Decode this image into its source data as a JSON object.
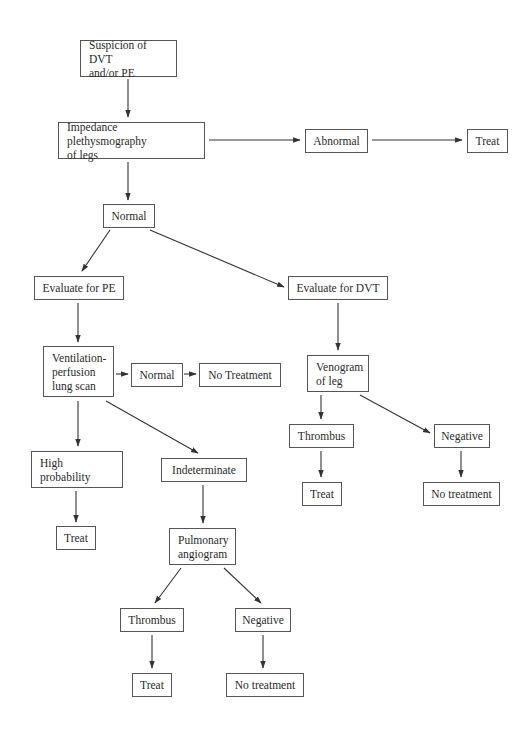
{
  "diagram": {
    "type": "flowchart",
    "title": "",
    "colors": {
      "stroke": "#333333",
      "text": "#2a2a2a",
      "background": "#ffffff"
    },
    "nodes": {
      "suspicion": {
        "label": "Suspicion of DVT\nand/or PE"
      },
      "impedance": {
        "label": "Impedance plethysmography\nof legs"
      },
      "abnormal": {
        "label": "Abnormal"
      },
      "treat_top": {
        "label": "Treat"
      },
      "normal_ipg": {
        "label": "Normal"
      },
      "eval_pe": {
        "label": "Evaluate for PE"
      },
      "eval_dvt": {
        "label": "Evaluate for DVT"
      },
      "vq_scan": {
        "label": "Ventilation-\nperfusion\nlung scan"
      },
      "normal_vq": {
        "label": "Normal"
      },
      "no_treatment_vq": {
        "label": "No Treatment"
      },
      "high_prob": {
        "label": "High\nprobability"
      },
      "indeterminate": {
        "label": "Indeterminate"
      },
      "treat_high": {
        "label": "Treat"
      },
      "pulm_angio": {
        "label": "Pulmonary\nangiogram"
      },
      "thrombus_pe": {
        "label": "Thrombus"
      },
      "negative_pe": {
        "label": "Negative"
      },
      "treat_pe": {
        "label": "Treat"
      },
      "no_treatment_pe": {
        "label": "No treatment"
      },
      "venogram": {
        "label": "Venogram\nof leg"
      },
      "thrombus_dvt": {
        "label": "Thrombus"
      },
      "negative_dvt": {
        "label": "Negative"
      },
      "treat_dvt": {
        "label": "Treat"
      },
      "no_treatment_dvt": {
        "label": "No treatment"
      }
    },
    "edges": [
      [
        "suspicion",
        "impedance"
      ],
      [
        "impedance",
        "abnormal"
      ],
      [
        "abnormal",
        "treat_top"
      ],
      [
        "impedance",
        "normal_ipg"
      ],
      [
        "normal_ipg",
        "eval_pe"
      ],
      [
        "normal_ipg",
        "eval_dvt"
      ],
      [
        "eval_pe",
        "vq_scan"
      ],
      [
        "vq_scan",
        "normal_vq"
      ],
      [
        "normal_vq",
        "no_treatment_vq"
      ],
      [
        "vq_scan",
        "high_prob"
      ],
      [
        "vq_scan",
        "indeterminate"
      ],
      [
        "high_prob",
        "treat_high"
      ],
      [
        "indeterminate",
        "pulm_angio"
      ],
      [
        "pulm_angio",
        "thrombus_pe"
      ],
      [
        "pulm_angio",
        "negative_pe"
      ],
      [
        "thrombus_pe",
        "treat_pe"
      ],
      [
        "negative_pe",
        "no_treatment_pe"
      ],
      [
        "eval_dvt",
        "venogram"
      ],
      [
        "venogram",
        "thrombus_dvt"
      ],
      [
        "venogram",
        "negative_dvt"
      ],
      [
        "thrombus_dvt",
        "treat_dvt"
      ],
      [
        "negative_dvt",
        "no_treatment_dvt"
      ]
    ]
  }
}
